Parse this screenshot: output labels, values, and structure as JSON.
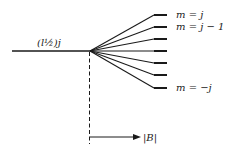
{
  "diagram": {
    "level_label": "(l½)j",
    "sublevel_labels": {
      "top": "m = j",
      "second": "m = j − 1",
      "bottom": "m = −j"
    },
    "axis_label": "|B|",
    "sublevel_count": 7,
    "colors": {
      "line": "#1a1a1a",
      "background": "#ffffff"
    }
  }
}
